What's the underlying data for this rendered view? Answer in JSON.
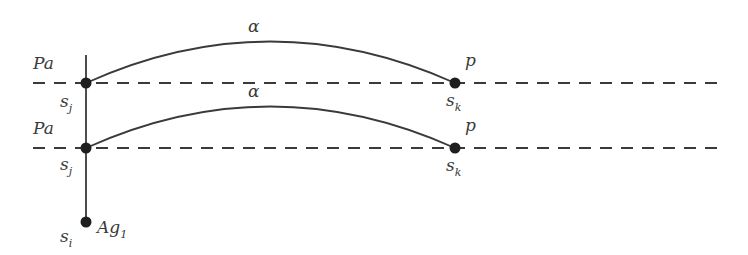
{
  "diagram": {
    "type": "state-transition",
    "colors": {
      "line": "#3a3a3a",
      "node": "#1e1e1e",
      "background": "#ffffff"
    },
    "levels": [
      {
        "source": {
          "label": "Pa",
          "state": "s",
          "state_sub": "j"
        },
        "target": {
          "label": "p",
          "state": "s",
          "state_sub": "k"
        },
        "edge_label": "α"
      },
      {
        "source": {
          "label": "Pa",
          "state": "s",
          "state_sub": "j"
        },
        "target": {
          "label": "p",
          "state": "s",
          "state_sub": "k"
        },
        "edge_label": "α"
      }
    ],
    "root": {
      "state": "s",
      "state_sub": "i",
      "agent": "Ag",
      "agent_sub": "1"
    }
  }
}
